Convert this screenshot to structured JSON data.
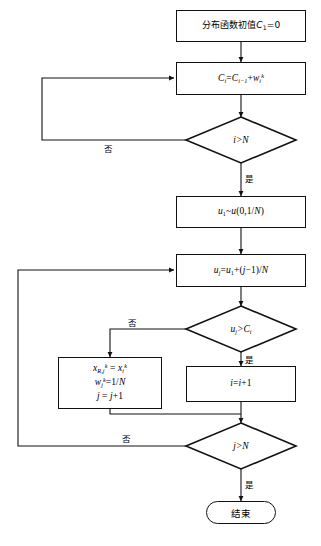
{
  "diagram": {
    "language": "zh-CN",
    "type": "flowchart",
    "stroke_color": "#111111",
    "fill_color": "#ffffff",
    "caption": ""
  },
  "nodes": {
    "init": {
      "kind": "process",
      "label": "分布函数初值C₁=0",
      "label_parts": {
        "text": "分布函数初值",
        "var": "C",
        "sub": "1",
        "eq": "=0"
      }
    },
    "cumsum": {
      "kind": "process",
      "label": "Cᵢ=Cᵢ₋₁+wᵢᵏ"
    },
    "decide_i_gt_n": {
      "kind": "decision",
      "label": "i>N",
      "yes_label": "是",
      "no_label": "否"
    },
    "draw_u1": {
      "kind": "process",
      "label": "u₁~u(0,1/N)"
    },
    "uj": {
      "kind": "process",
      "label": "uⱼ=u₁+(j−1)/N"
    },
    "decide_uj_gt_ci": {
      "kind": "decision",
      "label": "uⱼ>Cᵢ",
      "yes_label": "是",
      "no_label": "否"
    },
    "assign": {
      "kind": "process-multiline",
      "lines": [
        "xᵏʀ,ⱼ = xᵢᵏ",
        "wⱼᵏ=1/N",
        "j = j+1"
      ]
    },
    "incr_i": {
      "kind": "process",
      "label": "i=i+1"
    },
    "decide_j_gt_n": {
      "kind": "decision",
      "label": "j>N",
      "yes_label": "是",
      "no_label": "否"
    },
    "end": {
      "kind": "terminal",
      "label": "结束"
    }
  },
  "edge_labels": {
    "i_gt_n_no": "否",
    "i_gt_n_yes": "是",
    "uj_gt_ci_no": "否",
    "uj_gt_ci_yes": "是",
    "j_gt_n_no": "否",
    "j_gt_n_yes": "是"
  }
}
